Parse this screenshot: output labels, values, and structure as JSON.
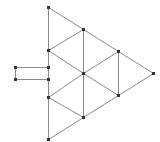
{
  "diagram": {
    "colors": {
      "edge": "#8a8a8a",
      "node": "#333333",
      "background": "#ffffff"
    },
    "nodes": [
      {
        "id": "A",
        "x": 48,
        "y": 7
      },
      {
        "id": "B",
        "x": 83,
        "y": 29
      },
      {
        "id": "C",
        "x": 48,
        "y": 50
      },
      {
        "id": "D",
        "x": 118,
        "y": 51
      },
      {
        "id": "E",
        "x": 83,
        "y": 73
      },
      {
        "id": "F",
        "x": 153,
        "y": 73
      },
      {
        "id": "G",
        "x": 48,
        "y": 97
      },
      {
        "id": "H",
        "x": 118,
        "y": 95
      },
      {
        "id": "I",
        "x": 83,
        "y": 117
      },
      {
        "id": "J",
        "x": 48,
        "y": 139
      },
      {
        "id": "K",
        "x": 15,
        "y": 67
      },
      {
        "id": "L",
        "x": 48,
        "y": 67
      },
      {
        "id": "M",
        "x": 15,
        "y": 79
      },
      {
        "id": "N",
        "x": 48,
        "y": 79
      }
    ],
    "edges": [
      [
        "A",
        "B"
      ],
      [
        "B",
        "D"
      ],
      [
        "D",
        "F"
      ],
      [
        "F",
        "H"
      ],
      [
        "H",
        "I"
      ],
      [
        "I",
        "J"
      ],
      [
        "A",
        "C"
      ],
      [
        "C",
        "L"
      ],
      [
        "L",
        "N"
      ],
      [
        "N",
        "G"
      ],
      [
        "G",
        "J"
      ],
      [
        "B",
        "C"
      ],
      [
        "B",
        "E"
      ],
      [
        "E",
        "I"
      ],
      [
        "C",
        "E"
      ],
      [
        "E",
        "D"
      ],
      [
        "D",
        "H"
      ],
      [
        "E",
        "H"
      ],
      [
        "E",
        "G"
      ],
      [
        "G",
        "I"
      ],
      [
        "K",
        "L"
      ],
      [
        "M",
        "N"
      ],
      [
        "K",
        "M"
      ]
    ]
  }
}
